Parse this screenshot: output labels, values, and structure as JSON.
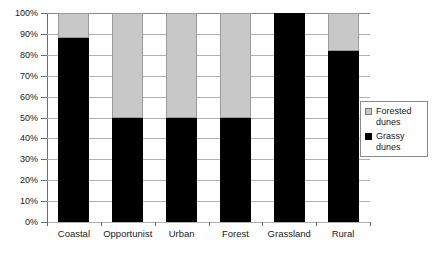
{
  "chart_data": {
    "type": "bar",
    "subtype": "stacked-100-percent",
    "title": "",
    "xlabel": "",
    "ylabel": "",
    "ylim": [
      0,
      100
    ],
    "ytick_labels": [
      "100%",
      "90%",
      "80%",
      "70%",
      "60%",
      "50%",
      "40%",
      "30%",
      "20%",
      "10%",
      "0%"
    ],
    "ytick_values": [
      100,
      90,
      80,
      70,
      60,
      50,
      40,
      30,
      20,
      10,
      0
    ],
    "grid": true,
    "legend_position": "right",
    "categories": [
      "Coastal",
      "Opportunist",
      "Urban",
      "Forest",
      "Grassland",
      "Rural"
    ],
    "series": [
      {
        "name": "Grassy dunes",
        "color": "#000000",
        "values": [
          88,
          50,
          50,
          50,
          100,
          82
        ]
      },
      {
        "name": "Forested dunes",
        "color": "#c8c8c8",
        "values": [
          12,
          50,
          50,
          50,
          0,
          18
        ]
      }
    ]
  },
  "legend": {
    "items": [
      {
        "label_line1": "Forested",
        "label_line2": "dunes",
        "swatch": "gray-square-icon"
      },
      {
        "label_line1": "Grassy",
        "label_line2": "dunes",
        "swatch": "black-square-icon"
      }
    ]
  }
}
